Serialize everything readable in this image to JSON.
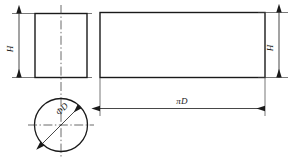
{
  "drawing": {
    "title": "Cylinder surface development drawing",
    "dimensions": {
      "height_left": "H",
      "height_right": "H",
      "developed_length": "πD",
      "diameter": "ΦD"
    },
    "views": {
      "end_view_label": "square end view",
      "development_label": "unrolled lateral surface",
      "section_label": "circular cross section"
    },
    "colors": {
      "outline": "#1a1a1a",
      "dimension": "#262626",
      "center": "#3a3a3a",
      "background": "#ffffff"
    }
  }
}
